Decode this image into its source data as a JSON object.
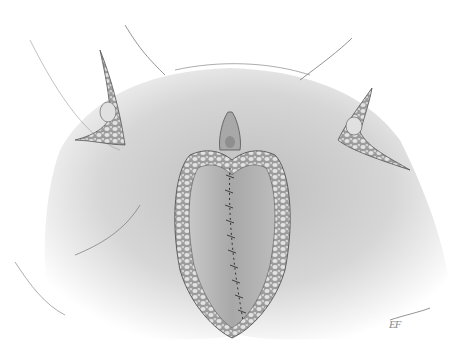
{
  "illustration": {
    "subject": "surgical anatomical illustration with sutured midline incision and fatty tissue flaps",
    "style": "grayscale pencil shading",
    "signature": "EF",
    "colors": {
      "background": "#ffffff",
      "skin_light": "#e6e6e6",
      "skin_mid": "#c4c4c4",
      "skin_dark": "#9a9a9a",
      "outline": "#555555",
      "fat_tissue": "#d8d8d8",
      "suture": "#333333"
    }
  }
}
